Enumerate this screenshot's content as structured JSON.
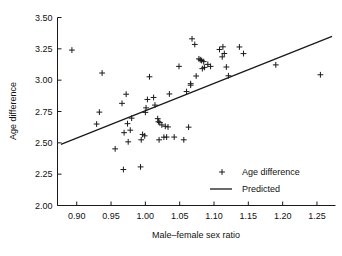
{
  "chart_data": {
    "type": "scatter",
    "title": "",
    "xlabel": "Male–female sex ratio",
    "ylabel": "Age difference",
    "xlim": [
      0.872,
      1.277
    ],
    "ylim": [
      2.0,
      3.5
    ],
    "xticks": [
      0.9,
      0.95,
      1.0,
      1.05,
      1.1,
      1.15,
      1.2,
      1.25
    ],
    "xticklabels": [
      "0.90",
      "0.95",
      "1.00",
      "1.05",
      "1.10",
      "1.15",
      "1.20",
      "1.25"
    ],
    "yticks": [
      2.0,
      2.25,
      2.5,
      2.75,
      3.0,
      3.25,
      3.5
    ],
    "yticklabels": [
      "2.00",
      "2.25",
      "2.50",
      "2.75",
      "3.00",
      "3.25",
      "3.50"
    ],
    "grid": false,
    "legend_position": "lower-right",
    "legend": [
      {
        "label": "Age difference",
        "marker": "plus"
      },
      {
        "label": "Predicted",
        "marker": "line"
      }
    ],
    "series": [
      {
        "name": "Age difference",
        "marker": "plus",
        "color": "#1a1a1a",
        "points": [
          [
            0.893,
            3.24
          ],
          [
            0.937,
            3.057
          ],
          [
            0.929,
            2.65
          ],
          [
            0.933,
            2.745
          ],
          [
            0.956,
            2.452
          ],
          [
            0.966,
            2.815
          ],
          [
            0.968,
            2.287
          ],
          [
            0.969,
            2.581
          ],
          [
            0.972,
            2.888
          ],
          [
            0.974,
            2.653
          ],
          [
            0.975,
            2.508
          ],
          [
            0.978,
            2.601
          ],
          [
            0.98,
            2.697
          ],
          [
            0.993,
            2.308
          ],
          [
            0.994,
            2.524
          ],
          [
            0.996,
            2.567
          ],
          [
            0.999,
            2.556
          ],
          [
            1.0,
            2.743
          ],
          [
            1.001,
            2.779
          ],
          [
            1.003,
            2.846
          ],
          [
            1.006,
            3.027
          ],
          [
            1.012,
            2.862
          ],
          [
            1.014,
            2.801
          ],
          [
            1.018,
            2.693
          ],
          [
            1.019,
            2.668
          ],
          [
            1.02,
            2.524
          ],
          [
            1.021,
            2.663
          ],
          [
            1.024,
            2.643
          ],
          [
            1.027,
            2.545
          ],
          [
            1.029,
            2.632
          ],
          [
            1.031,
            2.546
          ],
          [
            1.033,
            2.627
          ],
          [
            1.035,
            2.89
          ],
          [
            1.042,
            2.546
          ],
          [
            1.049,
            3.11
          ],
          [
            1.056,
            2.524
          ],
          [
            1.06,
            2.909
          ],
          [
            1.063,
            2.625
          ],
          [
            1.066,
            2.96
          ],
          [
            1.066,
            2.972
          ],
          [
            1.068,
            3.33
          ],
          [
            1.072,
            3.285
          ],
          [
            1.074,
            3.033
          ],
          [
            1.078,
            3.17
          ],
          [
            1.08,
            3.163
          ],
          [
            1.082,
            3.157
          ],
          [
            1.083,
            3.092
          ],
          [
            1.085,
            3.148
          ],
          [
            1.086,
            3.102
          ],
          [
            1.091,
            3.126
          ],
          [
            1.095,
            3.11
          ],
          [
            1.108,
            3.245
          ],
          [
            1.112,
            3.186
          ],
          [
            1.113,
            3.266
          ],
          [
            1.115,
            3.213
          ],
          [
            1.118,
            3.105
          ],
          [
            1.121,
            3.035
          ],
          [
            1.137,
            3.265
          ],
          [
            1.143,
            3.212
          ],
          [
            1.19,
            3.122
          ],
          [
            1.255,
            3.043
          ]
        ]
      }
    ],
    "fit_line": {
      "name": "Predicted",
      "color": "#1a1a1a",
      "x": [
        0.877,
        1.272
      ],
      "y": [
        2.487,
        3.35
      ]
    }
  }
}
